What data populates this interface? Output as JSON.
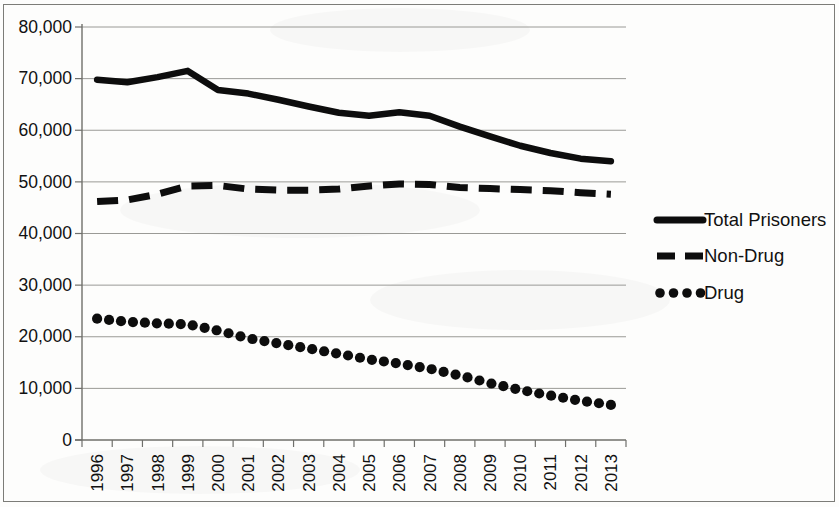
{
  "chart_data": {
    "type": "line",
    "title": "",
    "xlabel": "",
    "ylabel": "",
    "categories": [
      "1996",
      "1997",
      "1998",
      "1999",
      "2000",
      "2001",
      "2002",
      "2003",
      "2004",
      "2005",
      "2006",
      "2007",
      "2008",
      "2009",
      "2010",
      "2011",
      "2012",
      "2013"
    ],
    "ylim": [
      0,
      80000
    ],
    "ytick_labels": [
      "0",
      "10,000",
      "20,000",
      "30,000",
      "40,000",
      "50,000",
      "60,000",
      "70,000",
      "80,000"
    ],
    "ytick_values": [
      0,
      10000,
      20000,
      30000,
      40000,
      50000,
      60000,
      70000,
      80000
    ],
    "grid": true,
    "legend_position": "right",
    "series": [
      {
        "name": "Total Prisoners",
        "style": "solid",
        "color": "#0d0d0d",
        "values": [
          69800,
          69300,
          70300,
          71500,
          67800,
          67100,
          65900,
          64600,
          63400,
          62800,
          63500,
          62800,
          60700,
          58800,
          57000,
          55600,
          54500,
          54000
        ]
      },
      {
        "name": "Non-Drug",
        "style": "dashed",
        "color": "#0d0d0d",
        "values": [
          46200,
          46500,
          47600,
          49200,
          49300,
          48600,
          48400,
          48400,
          48600,
          49200,
          49600,
          49500,
          48900,
          48700,
          48500,
          48300,
          47900,
          47600
        ]
      },
      {
        "name": "Drug",
        "style": "dotted",
        "color": "#0d0d0d",
        "values": [
          23500,
          22900,
          22600,
          22400,
          21200,
          19700,
          18700,
          17700,
          16700,
          15600,
          14800,
          13800,
          12500,
          11000,
          9700,
          8600,
          7600,
          6800
        ]
      }
    ]
  },
  "legend": {
    "items": [
      {
        "label": "Total Prisoners",
        "style": "solid"
      },
      {
        "label": "Non-Drug",
        "style": "dashed"
      },
      {
        "label": "Drug",
        "style": "dotted"
      }
    ]
  }
}
